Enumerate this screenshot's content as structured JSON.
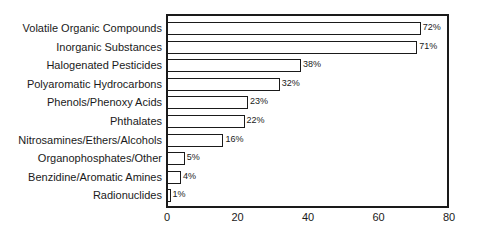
{
  "chart_data": {
    "type": "bar",
    "orientation": "horizontal",
    "title": "",
    "xlabel": "",
    "ylabel": "",
    "categories": [
      "Volatile Organic Compounds",
      "Inorganic Substances",
      "Halogenated Pesticides",
      "Polyaromatic Hydrocarbons",
      "Phenols/Phenoxy Acids",
      "Phthalates",
      "Nitrosamines/Ethers/Alcohols",
      "Organophosphates/Other",
      "Benzidine/Aromatic Amines",
      "Radionuclides"
    ],
    "values": [
      72,
      71,
      38,
      32,
      23,
      22,
      16,
      5,
      4,
      1
    ],
    "value_labels": [
      "72%",
      "71%",
      "38%",
      "32%",
      "23%",
      "22%",
      "16%",
      "5%",
      "4%",
      "1%"
    ],
    "xlim": [
      0,
      80
    ],
    "x_ticks": [
      "0",
      "20",
      "40",
      "60",
      "80"
    ],
    "grid": false,
    "legend": null,
    "bar_fill": "#ffffff",
    "bar_stroke": "#1a1a1a"
  }
}
